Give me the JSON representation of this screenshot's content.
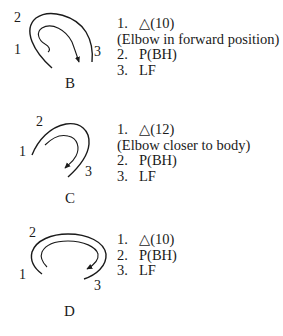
{
  "figures": [
    {
      "id": "B",
      "caption": "B",
      "point_labels": [
        "1",
        "2",
        "3"
      ],
      "steps": [
        {
          "num": "1.",
          "text": "△(10)"
        },
        {
          "note": "(Elbow in forward position)"
        },
        {
          "num": "2.",
          "text": "P(BH)"
        },
        {
          "num": "3.",
          "text": "LF"
        }
      ]
    },
    {
      "id": "C",
      "caption": "C",
      "point_labels": [
        "1",
        "2",
        "3"
      ],
      "steps": [
        {
          "num": "1.",
          "text": "△(12)"
        },
        {
          "note": "(Elbow closer to body)"
        },
        {
          "num": "2.",
          "text": "P(BH)"
        },
        {
          "num": "3.",
          "text": "LF"
        }
      ]
    },
    {
      "id": "D",
      "caption": "D",
      "point_labels": [
        "1",
        "2",
        "3"
      ],
      "steps": [
        {
          "num": "1.",
          "text": "△(10)"
        },
        {
          "num": "2.",
          "text": "P(BH)"
        },
        {
          "num": "3.",
          "text": "LF"
        }
      ]
    }
  ],
  "colors": {
    "ink": "#1a1a1a",
    "background": "#ffffff"
  }
}
